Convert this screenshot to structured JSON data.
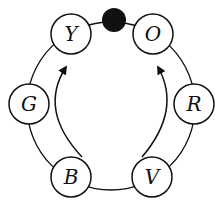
{
  "diagram": {
    "type": "color-wheel",
    "top_marker": "filled-circle",
    "nodes": [
      {
        "id": "Y",
        "label": "Y",
        "cx": 71,
        "cy": 34
      },
      {
        "id": "O",
        "label": "O",
        "cx": 153,
        "cy": 34
      },
      {
        "id": "R",
        "label": "R",
        "cx": 194,
        "cy": 104
      },
      {
        "id": "V",
        "label": "V",
        "cx": 152,
        "cy": 177
      },
      {
        "id": "B",
        "label": "B",
        "cx": 71,
        "cy": 177
      },
      {
        "id": "G",
        "label": "G",
        "cx": 29,
        "cy": 104
      }
    ],
    "arrows": [
      {
        "from": "B",
        "to": "Y"
      },
      {
        "from": "V",
        "to": "O"
      }
    ],
    "colors": {
      "stroke": "#111111",
      "background": "#ffffff"
    }
  }
}
